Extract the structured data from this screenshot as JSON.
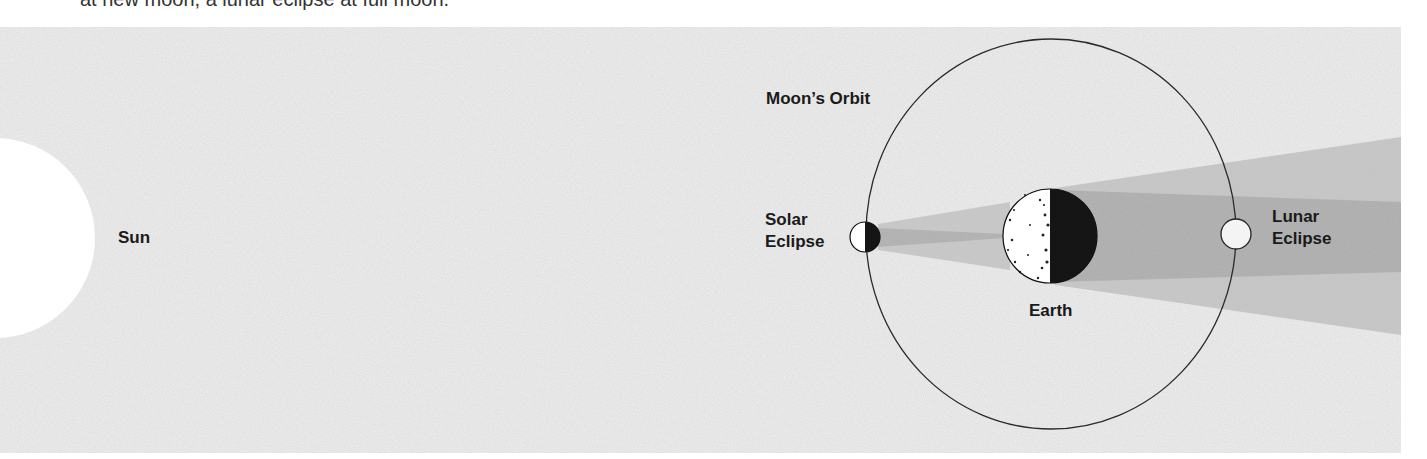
{
  "caption": {
    "text_partial": "at new moon, a lunar eclipse at full moon."
  },
  "labels": {
    "sun": "Sun",
    "moons_orbit": "Moon’s Orbit",
    "solar_eclipse_line1": "Solar",
    "solar_eclipse_line2": "Eclipse",
    "earth": "Earth",
    "lunar_eclipse_line1": "Lunar",
    "lunar_eclipse_line2": "Eclipse"
  },
  "colors": {
    "background_field": "#ececec",
    "penumbra": "#c4c4c4",
    "umbra": "#ababab",
    "body_light": "#ffffff",
    "body_dark": "#151515",
    "orbit_line": "#2a2a2a"
  },
  "bodies": {
    "sun": {
      "cx": -5,
      "cy": 238,
      "r": 100
    },
    "earth": {
      "cx": 1050,
      "cy": 236,
      "r": 47
    },
    "moon_new": {
      "cx": 865,
      "cy": 237,
      "r": 15
    },
    "moon_full": {
      "cx": 1236,
      "cy": 234,
      "r": 15
    },
    "orbit": {
      "cx": 1051,
      "cy": 234,
      "rx": 185,
      "ry": 195
    }
  }
}
